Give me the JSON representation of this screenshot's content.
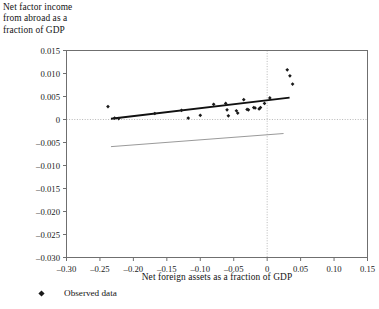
{
  "chart_data": {
    "type": "scatter",
    "title": "",
    "ylabel": "Net factor income from abroad as a fraction of GDP",
    "ylabel_lines": [
      "Net factor income",
      "from abroad as a",
      "fraction of GDP"
    ],
    "xlabel": "Net foreign assets as a fraction of GDP",
    "xlim": [
      -0.3,
      0.15
    ],
    "ylim": [
      -0.03,
      0.015
    ],
    "xticks": [
      -0.3,
      -0.25,
      -0.2,
      -0.15,
      -0.1,
      -0.05,
      0,
      0.05,
      0.1,
      0.15
    ],
    "xtick_labels": [
      "–0.30",
      "–0.25",
      "–0.20",
      "–0.15",
      "–0.10",
      "–0.05",
      "0",
      "0.05",
      "0.10",
      "0.15"
    ],
    "yticks": [
      0.015,
      0.01,
      0.005,
      0,
      -0.005,
      -0.01,
      -0.015,
      -0.02,
      -0.025,
      -0.03
    ],
    "ytick_labels": [
      "0.015",
      "0.010",
      "0.005",
      "0",
      "–0.005",
      "–0.010",
      "–0.015",
      "–0.020",
      "–0.025",
      "–0.030"
    ],
    "grid": "dotted-zero-lines",
    "zero_gridline_x": 0,
    "zero_gridline_y": 0,
    "legend": [
      {
        "label": "Observed data",
        "marker": "diamond",
        "color": "#1a1a1a"
      }
    ],
    "legend_position": "below-axis-left",
    "series": [
      {
        "name": "Observed data",
        "type": "scatter",
        "marker": "diamond",
        "color": "#1a1a1a",
        "points": [
          {
            "x": -0.238,
            "y": 0.0028
          },
          {
            "x": -0.228,
            "y": 0.0003
          },
          {
            "x": -0.222,
            "y": 0.0002
          },
          {
            "x": -0.168,
            "y": 0.0013
          },
          {
            "x": -0.128,
            "y": 0.002
          },
          {
            "x": -0.118,
            "y": 0.0003
          },
          {
            "x": -0.1,
            "y": 0.0009
          },
          {
            "x": -0.08,
            "y": 0.0033
          },
          {
            "x": -0.062,
            "y": 0.0035
          },
          {
            "x": -0.06,
            "y": 0.0021
          },
          {
            "x": -0.058,
            "y": 0.0008
          },
          {
            "x": -0.046,
            "y": 0.0019
          },
          {
            "x": -0.044,
            "y": 0.0014
          },
          {
            "x": -0.035,
            "y": 0.0043
          },
          {
            "x": -0.03,
            "y": 0.0022
          },
          {
            "x": -0.028,
            "y": 0.0021
          },
          {
            "x": -0.02,
            "y": 0.0026
          },
          {
            "x": -0.018,
            "y": 0.0025
          },
          {
            "x": -0.012,
            "y": 0.0023
          },
          {
            "x": -0.01,
            "y": 0.0026
          },
          {
            "x": -0.004,
            "y": 0.0035
          },
          {
            "x": 0.004,
            "y": 0.0047
          },
          {
            "x": 0.03,
            "y": 0.0108
          },
          {
            "x": 0.034,
            "y": 0.0095
          },
          {
            "x": 0.038,
            "y": 0.0077
          }
        ]
      },
      {
        "name": "fitted-line",
        "type": "line",
        "style": "solid-thick",
        "color": "#111111",
        "endpoints": [
          {
            "x": -0.2335,
            "y": 0.00015
          },
          {
            "x": 0.0335,
            "y": 0.00475
          }
        ]
      },
      {
        "name": "reference-line",
        "type": "line",
        "style": "solid-thin",
        "color": "#9a9a9a",
        "endpoints": [
          {
            "x": -0.2335,
            "y": -0.0059
          },
          {
            "x": 0.0245,
            "y": -0.00305
          }
        ]
      }
    ]
  }
}
